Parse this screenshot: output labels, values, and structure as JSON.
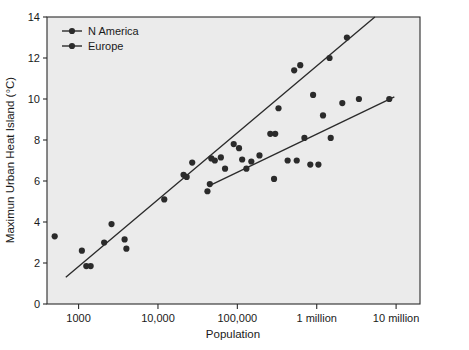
{
  "chart_data": {
    "type": "scatter",
    "title": "",
    "xlabel": "Population",
    "ylabel": "Maximun Urban Heat Island (°C)",
    "xscale": "log",
    "yscale": "linear",
    "xlim": [
      400,
      20000000
    ],
    "ylim": [
      0,
      14
    ],
    "grid": false,
    "legend_position": "top-left",
    "xticks": [
      1000,
      10000,
      100000,
      1000000,
      10000000
    ],
    "xticklabels": [
      "1000",
      "10,000",
      "100,000",
      "1 million",
      "10 million"
    ],
    "yticks": [
      0,
      2,
      4,
      6,
      8,
      10,
      12,
      14
    ],
    "yticklabels": [
      "0",
      "2",
      "4",
      "6",
      "8",
      "10",
      "12",
      "14"
    ],
    "series": [
      {
        "name": "N America",
        "marker": "circle",
        "color": "#2b2b2b",
        "points": [
          {
            "x": 500,
            "y": 3.3
          },
          {
            "x": 1100,
            "y": 2.6
          },
          {
            "x": 1250,
            "y": 1.85
          },
          {
            "x": 1420,
            "y": 1.85
          },
          {
            "x": 2100,
            "y": 3.0
          },
          {
            "x": 2600,
            "y": 3.9
          },
          {
            "x": 3800,
            "y": 3.15
          },
          {
            "x": 4000,
            "y": 2.7
          },
          {
            "x": 12000,
            "y": 5.1
          },
          {
            "x": 21000,
            "y": 6.3
          },
          {
            "x": 23000,
            "y": 6.2
          },
          {
            "x": 27000,
            "y": 6.9
          },
          {
            "x": 42000,
            "y": 5.5
          },
          {
            "x": 47000,
            "y": 7.1
          },
          {
            "x": 52000,
            "y": 7.0
          },
          {
            "x": 62000,
            "y": 7.15
          },
          {
            "x": 90000,
            "y": 7.8
          },
          {
            "x": 105000,
            "y": 7.6
          },
          {
            "x": 130000,
            "y": 6.6
          },
          {
            "x": 260000,
            "y": 8.3
          },
          {
            "x": 300000,
            "y": 8.3
          },
          {
            "x": 330000,
            "y": 9.55
          },
          {
            "x": 520000,
            "y": 11.4
          },
          {
            "x": 620000,
            "y": 11.65
          },
          {
            "x": 900000,
            "y": 10.2
          },
          {
            "x": 1450000,
            "y": 12.0
          },
          {
            "x": 2400000,
            "y": 13.0
          }
        ]
      },
      {
        "name": "Europe",
        "marker": "circle",
        "color": "#2b2b2b",
        "points": [
          {
            "x": 45000,
            "y": 5.85
          },
          {
            "x": 70000,
            "y": 6.6
          },
          {
            "x": 115000,
            "y": 7.05
          },
          {
            "x": 150000,
            "y": 6.95
          },
          {
            "x": 190000,
            "y": 7.25
          },
          {
            "x": 290000,
            "y": 6.1
          },
          {
            "x": 430000,
            "y": 7.0
          },
          {
            "x": 560000,
            "y": 7.0
          },
          {
            "x": 700000,
            "y": 8.1
          },
          {
            "x": 830000,
            "y": 6.8
          },
          {
            "x": 1050000,
            "y": 6.8
          },
          {
            "x": 1200000,
            "y": 9.2
          },
          {
            "x": 1500000,
            "y": 8.1
          },
          {
            "x": 2100000,
            "y": 9.8
          },
          {
            "x": 3400000,
            "y": 10.0
          },
          {
            "x": 8200000,
            "y": 10.0
          }
        ]
      }
    ],
    "fit_lines": [
      {
        "name": "N America trend",
        "x_start": 690,
        "y_start": 1.3,
        "x_end": 5400000,
        "y_end": 14.0
      },
      {
        "name": "Europe trend",
        "x_start": 46000,
        "y_start": 5.8,
        "x_end": 9500000,
        "y_end": 10.1
      }
    ]
  },
  "legend": {
    "entries": [
      {
        "label": "N America"
      },
      {
        "label": "Europe"
      }
    ]
  },
  "axes": {
    "x_title": "Population",
    "y_title": "Maximun Urban Heat Island (°C)"
  }
}
